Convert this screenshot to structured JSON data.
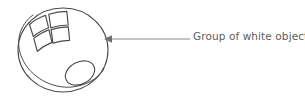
{
  "canvas": {
    "width": 305,
    "height": 100,
    "background": "#ffffff"
  },
  "style": {
    "stroke_color": "#4a4a4a",
    "leader_color": "#8a8a8a",
    "text_color": "#5d5d5d",
    "sphere_fill": "#ffffff",
    "stroke_width": 1.1
  },
  "annotation": {
    "label": "Group of white objects",
    "leader_line": {
      "from_x": 190,
      "to_x": 107,
      "y": 39
    },
    "arrowhead": {
      "tip_x": 104,
      "tip_y": 39,
      "direction": "left"
    }
  },
  "shapes": {
    "sphere": {
      "name": "sphere-outline",
      "center_x": 63,
      "center_y": 50,
      "radius_x": 45,
      "radius_y": 42
    },
    "sphere_highlight_arc": {
      "name": "sphere-inner-arc"
    },
    "window_logo": {
      "name": "window-pane-logo",
      "panes": 4
    },
    "small_ellipse": {
      "name": "small-ellipse-object",
      "center_x": 80,
      "center_y": 73,
      "radius_x": 15,
      "radius_y": 11,
      "rotation_deg": -28
    }
  }
}
